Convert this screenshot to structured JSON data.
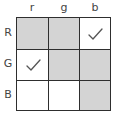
{
  "columns": [
    {
      "label": "r"
    },
    {
      "label": "g"
    },
    {
      "label": "b"
    }
  ],
  "rows": [
    {
      "label": "R",
      "cells": [
        {
          "shaded": true,
          "checked": false
        },
        {
          "shaded": true,
          "checked": false
        },
        {
          "shaded": false,
          "checked": true
        }
      ]
    },
    {
      "label": "G",
      "cells": [
        {
          "shaded": false,
          "checked": true
        },
        {
          "shaded": true,
          "checked": false
        },
        {
          "shaded": true,
          "checked": false
        }
      ]
    },
    {
      "label": "B",
      "cells": [
        {
          "shaded": false,
          "checked": false
        },
        {
          "shaded": false,
          "checked": false
        },
        {
          "shaded": true,
          "checked": false
        }
      ]
    }
  ],
  "colors": {
    "shaded": "#d4d4d4",
    "empty": "#ffffff",
    "border": "#2e2e2e",
    "check": "#555555"
  }
}
